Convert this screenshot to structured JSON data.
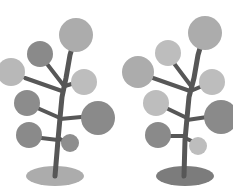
{
  "illustration": {
    "subject": "Two stylized trees with circular leaves",
    "background": "#ffffff",
    "trees": [
      {
        "id": "left-tree",
        "trunk_color": "#575757",
        "base": {
          "cx": 55,
          "cy": 176,
          "rx": 29,
          "ry": 10,
          "color": "#acacac"
        },
        "trunk_path": "M55 176 L58 140 L60 118 L62 97 L66 78 L70 55 L75 38",
        "branches": [
          "M62 91 L25 78",
          "M64 86 L44 60",
          "M65 86 L78 82",
          "M60 118 L35 107",
          "M60 119 L92 116",
          "M58 140 L33 137",
          "M58 138 L66 142"
        ],
        "leaves": [
          {
            "cx": 76,
            "cy": 35,
            "r": 17,
            "color": "#acacac"
          },
          {
            "cx": 40,
            "cy": 54,
            "r": 13,
            "color": "#8a8a8a"
          },
          {
            "cx": 11,
            "cy": 72,
            "r": 14,
            "color": "#b8b8b8"
          },
          {
            "cx": 84,
            "cy": 82,
            "r": 13,
            "color": "#bdbdbd"
          },
          {
            "cx": 27,
            "cy": 103,
            "r": 13,
            "color": "#8c8c8c"
          },
          {
            "cx": 98,
            "cy": 118,
            "r": 17,
            "color": "#8a8a8a"
          },
          {
            "cx": 29,
            "cy": 135,
            "r": 13,
            "color": "#8a8a8a"
          },
          {
            "cx": 70,
            "cy": 143,
            "r": 9,
            "color": "#8e8e8e"
          }
        ]
      },
      {
        "id": "right-tree",
        "trunk_color": "#575757",
        "base": {
          "cx": 185,
          "cy": 176,
          "rx": 29,
          "ry": 10,
          "color": "#7c7c7c"
        },
        "trunk_path": "M184 176 L185 140 L187 118 L189 97 L194 78 L198 55 L203 38",
        "branches": [
          "M190 91 L153 78",
          "M191 86 L173 62",
          "M193 90 L207 84",
          "M187 118 L164 107",
          "M187 120 L214 116",
          "M185 136 L163 136",
          "M185 138 L196 143"
        ],
        "leaves": [
          {
            "cx": 205,
            "cy": 33,
            "r": 17,
            "color": "#acacac"
          },
          {
            "cx": 168,
            "cy": 53,
            "r": 13,
            "color": "#bdbdbd"
          },
          {
            "cx": 138,
            "cy": 72,
            "r": 16,
            "color": "#acacac"
          },
          {
            "cx": 212,
            "cy": 82,
            "r": 13,
            "color": "#bdbdbd"
          },
          {
            "cx": 156,
            "cy": 103,
            "r": 13,
            "color": "#bdbdbd"
          },
          {
            "cx": 221,
            "cy": 117,
            "r": 17,
            "color": "#8a8a8a"
          },
          {
            "cx": 158,
            "cy": 135,
            "r": 13,
            "color": "#8a8a8a"
          },
          {
            "cx": 198,
            "cy": 146,
            "r": 9,
            "color": "#bdbdbd"
          }
        ]
      }
    ]
  }
}
